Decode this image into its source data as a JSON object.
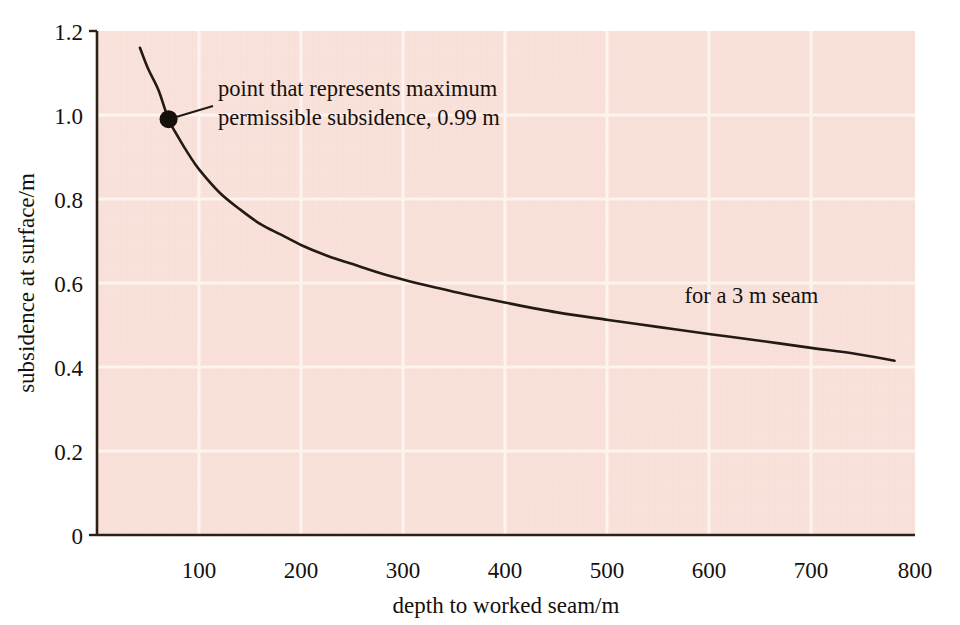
{
  "chart_data": {
    "type": "line",
    "title": "",
    "xlabel": "depth to worked seam/m",
    "ylabel": "subsidence at surface/m",
    "xlim": [
      0,
      800
    ],
    "ylim": [
      0,
      1.2
    ],
    "xticks": [
      100,
      200,
      300,
      400,
      500,
      600,
      700,
      800
    ],
    "xtick_labels": [
      "100",
      "200",
      "300",
      "400",
      "500",
      "600",
      "700",
      "800"
    ],
    "yticks": [
      0,
      0.2,
      0.4,
      0.6,
      0.8,
      1.0,
      1.2
    ],
    "ytick_labels": [
      "0",
      "0.2",
      "0.4",
      "0.6",
      "0.8",
      "1.0",
      "1.2"
    ],
    "grid": true,
    "grid_color": "#fdf3ef",
    "plot_background": "#f8e0d9",
    "line_color": "#231a14",
    "legend_position": "inline-right",
    "series": [
      {
        "name": "for a 3 m seam",
        "x": [
          42,
          50,
          60,
          70,
          80,
          90,
          100,
          120,
          140,
          160,
          180,
          200,
          225,
          250,
          275,
          300,
          330,
          360,
          400,
          450,
          500,
          550,
          600,
          650,
          700,
          740,
          780
        ],
        "y": [
          1.16,
          1.11,
          1.06,
          0.99,
          0.945,
          0.905,
          0.87,
          0.815,
          0.775,
          0.74,
          0.715,
          0.69,
          0.665,
          0.645,
          0.625,
          0.608,
          0.59,
          0.573,
          0.553,
          0.53,
          0.512,
          0.495,
          0.478,
          0.462,
          0.445,
          0.432,
          0.415
        ]
      }
    ],
    "annotations": [
      {
        "name": "max-permissible-subsidence",
        "lines": [
          "point that represents maximum",
          "permissible subsidence, 0.99 m"
        ],
        "point_x": 70,
        "point_y": 0.99,
        "marker": "filled-circle"
      },
      {
        "name": "series-inline-label",
        "lines": [
          "for a 3 m seam"
        ],
        "at_x": 640,
        "at_y": 0.5
      }
    ]
  },
  "figure": {
    "axis_color": "#231a14",
    "page_background": "#ffffff"
  }
}
